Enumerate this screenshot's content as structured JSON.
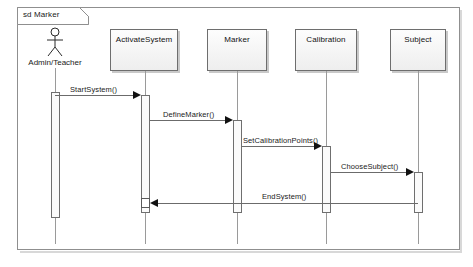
{
  "diagram": {
    "kind": "uml-sequence-diagram",
    "frame_label": "sd Marker",
    "colors": {
      "frame_border": "#8f8f8f",
      "box_border": "#6e6e6e",
      "box_fill": "#f4f4f4",
      "lifeline": "#9a9a9a",
      "message": "#6b6b6b",
      "text": "#1a1a1a"
    }
  },
  "actor": {
    "name": "actor-admin-teacher",
    "label": "Admin/Teacher",
    "icon": "stick-figure-actor-icon"
  },
  "participants": [
    {
      "label": "ActivateSystem"
    },
    {
      "label": "Marker"
    },
    {
      "label": "Calibration"
    },
    {
      "label": "Subject"
    }
  ],
  "messages": [
    {
      "label": "StartSystem()",
      "from": "Admin/Teacher",
      "to": "ActivateSystem",
      "direction": "right"
    },
    {
      "label": "DefineMarker()",
      "from": "ActivateSystem",
      "to": "Marker",
      "direction": "right"
    },
    {
      "label": "SetCalibrationPoints()",
      "from": "Marker",
      "to": "Calibration",
      "direction": "right"
    },
    {
      "label": "ChooseSubject()",
      "from": "Calibration",
      "to": "Subject",
      "direction": "right"
    },
    {
      "label": "EndSystem()",
      "from": "Subject",
      "to": "ActivateSystem",
      "direction": "left"
    }
  ]
}
